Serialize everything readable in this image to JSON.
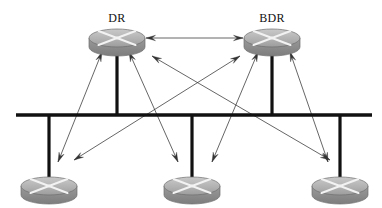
{
  "diagram": {
    "type": "network-topology",
    "canvas": {
      "width": 382,
      "height": 208,
      "background": "#ffffff"
    },
    "colors": {
      "bus": "#111111",
      "stub": "#111111",
      "arrow": "#333333",
      "router_body_top": "#b9b9b9",
      "router_body_side": "#8c8c8c",
      "router_outline": "#6f6f6f",
      "label_text": "#111111"
    },
    "bus": {
      "name": "broadcast-segment-bus",
      "y": 115,
      "x1": 16,
      "x2": 372,
      "thickness": 3.4
    },
    "labels": [
      {
        "id": "dr",
        "text": "DR",
        "x": 117,
        "y": 12
      },
      {
        "id": "bdr",
        "text": "BDR",
        "x": 272,
        "y": 12
      }
    ],
    "routers": [
      {
        "id": "dr",
        "name": "router-dr",
        "label": "DR",
        "cx": 117,
        "cy": 38,
        "rx": 28,
        "ry": 9,
        "depth": 9,
        "stub_to_bus": true
      },
      {
        "id": "bdr",
        "name": "router-bdr",
        "label": "BDR",
        "cx": 272,
        "cy": 38,
        "rx": 28,
        "ry": 9,
        "depth": 9,
        "stub_to_bus": true
      },
      {
        "id": "drother1",
        "name": "router-drother-left",
        "label": "",
        "cx": 49,
        "cy": 186,
        "rx": 28,
        "ry": 9,
        "depth": 9,
        "stub_to_bus": true
      },
      {
        "id": "drother2",
        "name": "router-drother-mid",
        "label": "",
        "cx": 192,
        "cy": 186,
        "rx": 28,
        "ry": 9,
        "depth": 9,
        "stub_to_bus": true
      },
      {
        "id": "drother3",
        "name": "router-drother-right",
        "label": "",
        "cx": 340,
        "cy": 186,
        "rx": 28,
        "ry": 9,
        "depth": 9,
        "stub_to_bus": true
      }
    ],
    "stubs": [
      {
        "name": "stub-dr",
        "x": 117,
        "y1": 48,
        "y2": 115
      },
      {
        "name": "stub-bdr",
        "x": 272,
        "y1": 48,
        "y2": 115
      },
      {
        "name": "stub-left",
        "x": 49,
        "y1": 115,
        "y2": 177
      },
      {
        "name": "stub-mid",
        "x": 192,
        "y1": 115,
        "y2": 177
      },
      {
        "name": "stub-right",
        "x": 340,
        "y1": 115,
        "y2": 177
      }
    ],
    "adjacencies": [
      {
        "name": "adjacency-dr-bdr",
        "from": "dr",
        "to": "bdr",
        "x1": 146,
        "y1": 38,
        "x2": 243,
        "y2": 38,
        "double": true
      },
      {
        "name": "adjacency-dr-left",
        "from": "dr",
        "to": "drother1",
        "x1": 102,
        "y1": 52,
        "x2": 58,
        "y2": 162,
        "double": true
      },
      {
        "name": "adjacency-dr-mid",
        "from": "dr",
        "to": "drother2",
        "x1": 129,
        "y1": 52,
        "x2": 178,
        "y2": 162,
        "double": true
      },
      {
        "name": "adjacency-dr-right",
        "from": "dr",
        "to": "drother3",
        "x1": 152,
        "y1": 56,
        "x2": 330,
        "y2": 160,
        "double": true
      },
      {
        "name": "adjacency-bdr-left",
        "from": "bdr",
        "to": "drother1",
        "x1": 240,
        "y1": 56,
        "x2": 74,
        "y2": 160,
        "double": true
      },
      {
        "name": "adjacency-bdr-mid",
        "from": "bdr",
        "to": "drother2",
        "x1": 258,
        "y1": 52,
        "x2": 212,
        "y2": 162,
        "double": true
      },
      {
        "name": "adjacency-bdr-right",
        "from": "bdr",
        "to": "drother3",
        "x1": 290,
        "y1": 52,
        "x2": 328,
        "y2": 162,
        "double": true
      }
    ]
  }
}
